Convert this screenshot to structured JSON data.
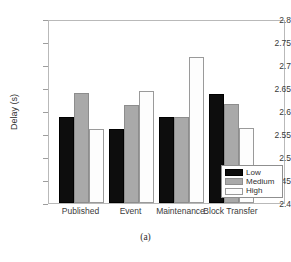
{
  "caption": "(a)",
  "chart_data": {
    "type": "bar",
    "title": "",
    "xlabel": "",
    "ylabel": "Delay (s)",
    "ylim": [
      2.4,
      2.8
    ],
    "yticks": [
      "2.4",
      "2.45",
      "2.5",
      "2.55",
      "2.6",
      "2.65",
      "2.7",
      "2.75",
      "2.8"
    ],
    "ytick_values": [
      2.4,
      2.45,
      2.5,
      2.55,
      2.6,
      2.65,
      2.7,
      2.75,
      2.8
    ],
    "grid": false,
    "legend_position": "lower right",
    "categories": [
      "Published",
      "Event",
      "Maintenance",
      "Block Transfer"
    ],
    "series": [
      {
        "name": "Low",
        "color": "#0d0d0d",
        "values": [
          2.587,
          2.561,
          2.588,
          2.638
        ]
      },
      {
        "name": "Medium",
        "color": "#a9a9a9",
        "values": [
          2.639,
          2.613,
          2.588,
          2.616
        ]
      },
      {
        "name": "High",
        "color": "#fdfdfd",
        "values": [
          2.56,
          2.644,
          2.718,
          2.562
        ]
      }
    ]
  }
}
